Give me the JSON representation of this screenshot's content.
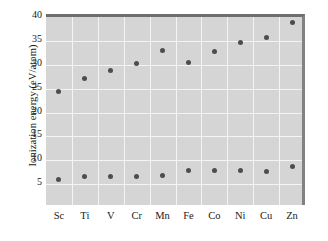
{
  "chart_data": {
    "type": "scatter",
    "title": "",
    "xlabel": "",
    "ylabel": "Ionization energy (eV/atom)",
    "categories": [
      "Sc",
      "Ti",
      "V",
      "Cr",
      "Mn",
      "Fe",
      "Co",
      "Ni",
      "Cu",
      "Zn"
    ],
    "ylim": [
      0,
      40
    ],
    "yticks": [
      5,
      10,
      15,
      20,
      25,
      30,
      35,
      40
    ],
    "ytick_labels": [
      "5",
      "10",
      "15",
      "20",
      "25",
      "30",
      "35",
      "40"
    ],
    "grid": true,
    "legend": "none",
    "series": [
      {
        "name": "second-ionization-energy",
        "values": [
          24.4,
          27.1,
          28.9,
          30.3,
          33.0,
          30.4,
          32.7,
          34.7,
          35.8,
          38.8
        ]
      },
      {
        "name": "first-ionization-energy",
        "values": [
          5.9,
          6.5,
          6.5,
          6.5,
          6.8,
          7.8,
          7.8,
          7.8,
          7.6,
          8.7
        ]
      }
    ],
    "colors": {
      "plot_background": "#d5d5d5",
      "gridline": "#f4f4f4",
      "marker": "#4d4d4d",
      "axis_border": "#6e6e6e",
      "text": "#1a1a1a",
      "figure_background": "#ffffff"
    }
  }
}
